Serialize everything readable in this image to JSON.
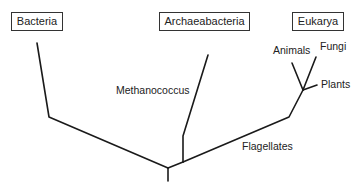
{
  "diagram": {
    "domains": [
      {
        "name": "Bacteria"
      },
      {
        "name": "Archaeabacteria"
      },
      {
        "name": "Eukarya"
      }
    ],
    "labels": {
      "methanococcus": "Methanococcus",
      "animals": "Animals",
      "fungi": "Fungi",
      "plants": "Plants",
      "flagellates": "Flagellates"
    },
    "colors": {
      "line": "#1a1a1a",
      "box_border": "#333333",
      "text": "#222222"
    }
  }
}
